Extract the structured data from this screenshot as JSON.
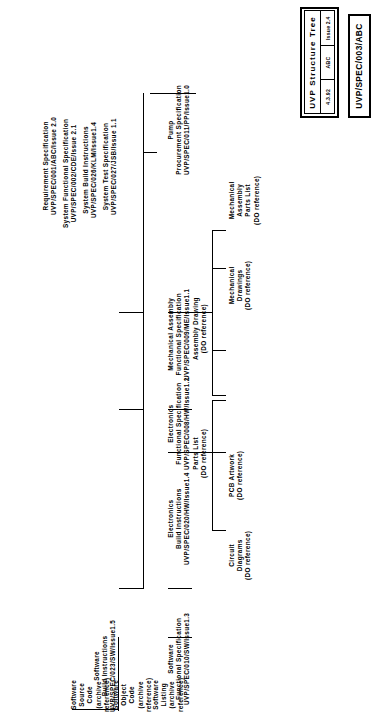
{
  "title_block": {
    "heading": "UVP  Structure  Tree",
    "cells": [
      "4.3.92",
      "ABC",
      "Issue 2.4"
    ],
    "doc_number": "UVP/SPEC/003/ABC"
  },
  "nodes": {
    "requirement_spec": {
      "l1": "Requirement Specification",
      "l2": "UVP/SPEC/001/ABC/Issue  2.0"
    },
    "system_functional_spec": {
      "l1": "System Functional Specification",
      "l2": "UVP/SPEC/002/CDE/Issue  2.1"
    },
    "system_build_instructions": {
      "l1": "System Build Instructions",
      "l2": "UVP/SPEC/026/KLM/Issue1.4"
    },
    "system_test_spec": {
      "l1": "System Test Specification",
      "l2": "UVP/SPEC/027/JSB/Issue  1.1"
    },
    "pump_procurement_spec": {
      "l1": "Pump",
      "l2": "Procurement  Specification",
      "l3": "UVP/SPEC/011/PP/Issue1.0"
    },
    "mechanical_assembly_functional_spec": {
      "l1": "Mechanical  Assembly",
      "l2": "Functional  Specification",
      "l3": "UVP/SPEC/009/ME/Issue1.1"
    },
    "assembly_drawing": {
      "l1": "Assembly  Drawing",
      "l2": "(DO  reference)"
    },
    "mechanical_drawings": {
      "l1": "Mechanical",
      "l2": "Drawings",
      "l3": "(DO  reference)"
    },
    "mechanical_assembly_parts_list": {
      "l1": "Mechanical",
      "l2": "Assembly",
      "l3": "Parts  List",
      "l4": "(DO  reference)"
    },
    "electronics_functional_spec": {
      "l1": "Electronics",
      "l2": "Functional  Specification",
      "l3": "UVP/SPEC/008/HW/Issue1.2"
    },
    "electronics_build_instructions": {
      "l1": "Electronics",
      "l2": "Build  Instructions",
      "l3": "UVP/SPEC/020/HW/Issue1.4"
    },
    "parts_list": {
      "l1": "Parts  List",
      "l2": "(DO  reference)"
    },
    "pcb_artwork": {
      "l1": "PCB  Artwork",
      "l2": "(DO  reference)"
    },
    "circuit_diagrams": {
      "l1": "Circuit",
      "l2": "Diagrams",
      "l3": "(DO  reference)"
    },
    "software_functional_spec": {
      "l1": "Software",
      "l2": "Functional  Specification",
      "l3": "UVP/SPEC/010/SW/Issue1.3"
    },
    "software_build_instructions": {
      "l1": "Software",
      "l2": "Build  Instructions",
      "l3": "UVP/SPEC/023/SW/Issue1.5"
    },
    "software_source_code": {
      "l1": "Software",
      "l2": "Source",
      "l3": "Code",
      "l4": "(archive",
      "l5": "reference)"
    },
    "software_object_code": {
      "l1": "Software",
      "l2": "Object",
      "l3": "Code",
      "l4": "(archive",
      "l5": "reference)"
    },
    "software_listing": {
      "l1": "Software",
      "l2": "Listing",
      "l3": "(archive",
      "l4": "reference)"
    }
  }
}
